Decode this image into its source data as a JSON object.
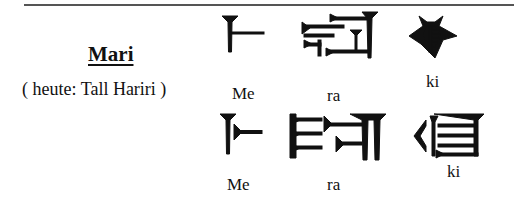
{
  "heading": {
    "place_name": "Mari",
    "modern_name": "( heute: Tall Hariri )"
  },
  "rows": [
    {
      "signs": [
        {
          "icon": "cuneiform-me-icon",
          "label": "Me"
        },
        {
          "icon": "cuneiform-ra-icon",
          "label": "ra"
        },
        {
          "icon": "cuneiform-ki-icon",
          "label": "ki"
        }
      ]
    },
    {
      "signs": [
        {
          "icon": "cuneiform-me-icon",
          "label": "Me"
        },
        {
          "icon": "cuneiform-ra-icon",
          "label": "ra"
        },
        {
          "icon": "cuneiform-ki-icon",
          "label": "ki"
        }
      ]
    }
  ],
  "colors": {
    "ink": "#111111",
    "rule": "#555555",
    "background": "#ffffff"
  }
}
